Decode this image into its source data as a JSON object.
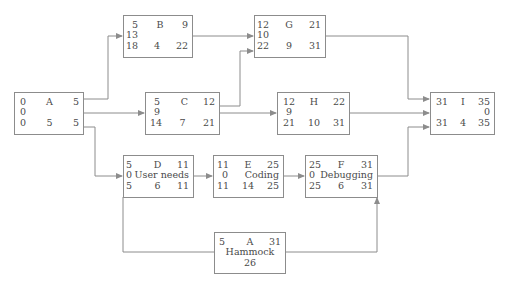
{
  "diagram": {
    "type": "activity-on-node network with hammock activity",
    "nodes": [
      {
        "id": "A",
        "es": "0",
        "ef": "5",
        "slack": "0",
        "ls": "0",
        "duration": "5",
        "lf": "5",
        "label": ""
      },
      {
        "id": "B",
        "es": "5",
        "ef": "9",
        "slack": "13",
        "ls": "18",
        "duration": "4",
        "lf": "22",
        "label": ""
      },
      {
        "id": "C",
        "es": "5",
        "ef": "12",
        "slack": "9",
        "ls": "14",
        "duration": "7",
        "lf": "21",
        "label": ""
      },
      {
        "id": "G",
        "es": "12",
        "ef": "21",
        "slack": "10",
        "ls": "22",
        "duration": "9",
        "lf": "31",
        "label": ""
      },
      {
        "id": "H",
        "es": "12",
        "ef": "22",
        "slack": "9",
        "ls": "21",
        "duration": "10",
        "lf": "31",
        "label": ""
      },
      {
        "id": "I",
        "es": "31",
        "ef": "35",
        "slack": "0",
        "ls": "31",
        "duration": "4",
        "lf": "35",
        "label": ""
      },
      {
        "id": "D",
        "es": "5",
        "ef": "11",
        "slack": "0",
        "ls": "5",
        "duration": "6",
        "lf": "11",
        "label": "User needs"
      },
      {
        "id": "E",
        "es": "11",
        "ef": "25",
        "slack": "0",
        "ls": "11",
        "duration": "14",
        "lf": "25",
        "label": "Coding"
      },
      {
        "id": "F",
        "es": "25",
        "ef": "31",
        "slack": "0",
        "ls": "25",
        "duration": "6",
        "lf": "31",
        "label": "Debugging"
      }
    ],
    "hammock": {
      "id": "A",
      "start": "5",
      "finish": "31",
      "label": "Hammock",
      "duration": "26"
    },
    "edges": [
      [
        "A",
        "B"
      ],
      [
        "A",
        "C"
      ],
      [
        "A",
        "D"
      ],
      [
        "B",
        "G"
      ],
      [
        "C",
        "G"
      ],
      [
        "C",
        "H"
      ],
      [
        "G",
        "I"
      ],
      [
        "H",
        "I"
      ],
      [
        "F",
        "I"
      ],
      [
        "D",
        "E"
      ],
      [
        "E",
        "F"
      ],
      [
        "D",
        "Hammock"
      ],
      [
        "Hammock",
        "F"
      ]
    ],
    "colors": {
      "line": "#8c8c8c",
      "text": "#4a4a4a",
      "background": "#ffffff"
    }
  }
}
